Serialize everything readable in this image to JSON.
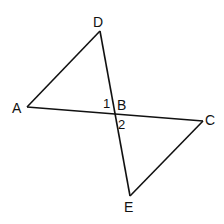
{
  "diagram": {
    "points": {
      "A": {
        "label": "A",
        "x": 27,
        "y": 107
      },
      "B": {
        "label": "B",
        "x": 115,
        "y": 114
      },
      "C": {
        "label": "C",
        "x": 203,
        "y": 121
      },
      "D": {
        "label": "D",
        "x": 100,
        "y": 31
      },
      "E": {
        "label": "E",
        "x": 130,
        "y": 196
      }
    },
    "angles": {
      "angle1": {
        "label": "1"
      },
      "angle2": {
        "label": "2"
      }
    },
    "line_color": "#111111"
  }
}
